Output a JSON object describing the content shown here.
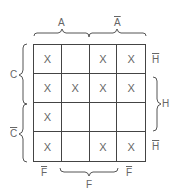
{
  "diagram": {
    "type": "karnaugh-map",
    "columns": [
      "A F̄",
      "A F",
      "Ā F",
      "Ā F̄"
    ],
    "rows": [
      "C H̄",
      "C H",
      "C̄ H",
      "C̄ H̄"
    ],
    "cells": [
      [
        "X",
        "",
        "X",
        "X"
      ],
      [
        "X",
        "X",
        "X",
        "X"
      ],
      [
        "X",
        "",
        "",
        ""
      ],
      [
        "X",
        "",
        "X",
        "X"
      ]
    ],
    "labels": {
      "top_left": "A",
      "top_right": "A",
      "left_top": "C",
      "left_bottom": "C",
      "right_row1": "H",
      "right_middle": "H",
      "right_row4": "H",
      "bottom_left": "F",
      "bottom_middle": "F",
      "bottom_right": "F"
    },
    "overlined": [
      "top_right",
      "left_bottom",
      "right_row1",
      "right_row4",
      "bottom_left",
      "bottom_right"
    ]
  }
}
